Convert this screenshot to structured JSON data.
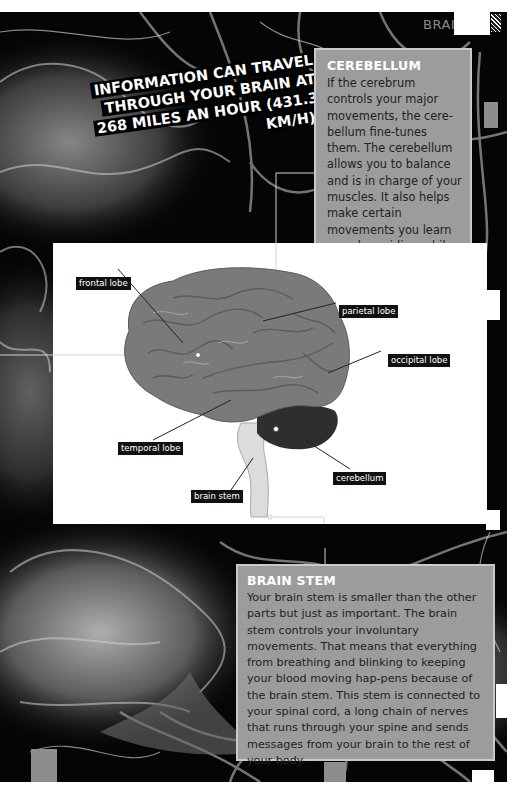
{
  "header": {
    "section_tag": "BRAIN"
  },
  "fact_callout": {
    "lines": [
      "INFORMATION CAN TRAVEL",
      "THROUGH YOUR BRAIN AT",
      "268 MILES AN HOUR (431.3 KM/H)."
    ]
  },
  "cerebellum_box": {
    "title": "CEREBELLUM",
    "body": "If the cerebrum controls your major movements, the cere-bellum fine-tunes them. The cerebellum allows you to balance and is in charge of your muscles. It also helps make certain movements you learn—such as riding a bike—become natural to you."
  },
  "diagram": {
    "labels": {
      "frontal_lobe": "frontal lobe",
      "parietal_lobe": "parietal lobe",
      "occipital_lobe": "occipital lobe",
      "temporal_lobe": "temporal lobe",
      "cerebellum": "cerebellum",
      "brain_stem": "brain stem"
    },
    "colors": {
      "cerebrum": "#7a7a7a",
      "cerebellum": "#2e2e2e",
      "brain_stem": "#dcdcdc"
    }
  },
  "brainstem_box": {
    "title": "BRAIN STEM",
    "body": "Your brain stem is smaller than the other parts but just as important. The brain stem controls your involuntary movements. That means that everything from breathing and blinking to keeping your blood moving hap-pens because of the brain stem. This stem is connected to your spinal cord, a long chain of nerves that runs through your spine and sends messages from your brain to the rest of your body."
  }
}
